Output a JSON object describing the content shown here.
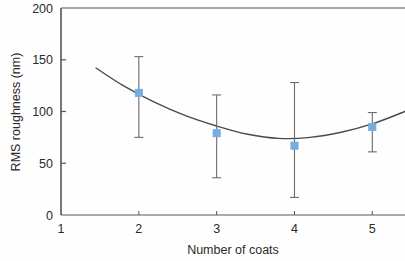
{
  "chart_data": {
    "type": "scatter",
    "title": "",
    "xlabel": "Number of coats",
    "ylabel": "RMS roughness (nm)",
    "xlim": [
      1,
      5.42
    ],
    "ylim": [
      0,
      200
    ],
    "xticks": [
      1,
      2,
      3,
      4,
      5
    ],
    "xticklabels": [
      "1",
      "2",
      "3",
      "4",
      "5"
    ],
    "yticks": [
      0,
      50,
      100,
      150,
      200
    ],
    "yticklabels": [
      "0",
      "50",
      "100",
      "150",
      "200"
    ],
    "grid": false,
    "legend": null,
    "marker_color": "#74ade0",
    "marker_shape": "square",
    "line_color": "#4a4a4a",
    "axis_color": "#4a4a4a",
    "series": [
      {
        "name": "RMS roughness",
        "x": [
          2,
          3,
          4,
          5
        ],
        "values": [
          118,
          79,
          67,
          85
        ],
        "err_low": [
          75,
          36,
          17,
          61
        ],
        "err_high": [
          153,
          116,
          128,
          99
        ]
      }
    ],
    "fit_curve": {
      "name": "quadratic fit",
      "x": [
        1.45,
        1.8,
        2.2,
        2.6,
        3.0,
        3.4,
        3.8,
        4.2,
        4.6,
        5.0,
        5.42
      ],
      "y": [
        142,
        125,
        109,
        96,
        86,
        78,
        74,
        75,
        80,
        88,
        100
      ]
    }
  },
  "figure": {
    "xlabel": "Number of coats",
    "ylabel": "RMS roughness (nm)"
  }
}
